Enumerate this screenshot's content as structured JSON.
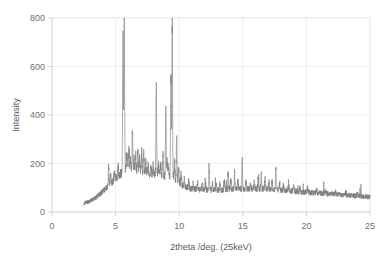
{
  "chart_data": {
    "type": "line",
    "title": "",
    "subtitle": "",
    "xlabel": "2theta /deg. (25keV)",
    "ylabel": "Intensity",
    "xlim": [
      0,
      25
    ],
    "ylim": [
      0,
      800
    ],
    "xticks": [
      0,
      5,
      10,
      15,
      20,
      25
    ],
    "yticks": [
      0,
      200,
      400,
      600,
      800
    ],
    "xtick_labels": [
      "0",
      "5",
      "10",
      "15",
      "20",
      "25"
    ],
    "ytick_labels": [
      "0",
      "200",
      "400",
      "600",
      "800"
    ],
    "grid": "both",
    "legend": "none",
    "series_name": "XRD pattern",
    "series_color": "#808080",
    "grid_color": "#e6e6e6",
    "axis_color": "#c9c9c9",
    "text_color": "#6f6f6f",
    "data_x_start": 2.5,
    "data_x_end": 25.0,
    "annotations": [],
    "notable_peaks": [
      {
        "x": 4.45,
        "y": 195
      },
      {
        "x": 5.58,
        "y": 745
      },
      {
        "x": 5.68,
        "y": 790
      },
      {
        "x": 6.05,
        "y": 250
      },
      {
        "x": 6.32,
        "y": 330
      },
      {
        "x": 6.75,
        "y": 245
      },
      {
        "x": 7.05,
        "y": 250
      },
      {
        "x": 7.22,
        "y": 240
      },
      {
        "x": 8.2,
        "y": 520
      },
      {
        "x": 8.72,
        "y": 250
      },
      {
        "x": 8.95,
        "y": 400
      },
      {
        "x": 9.35,
        "y": 560
      },
      {
        "x": 9.45,
        "y": 770
      },
      {
        "x": 9.8,
        "y": 305
      },
      {
        "x": 12.35,
        "y": 190
      },
      {
        "x": 13.85,
        "y": 165
      },
      {
        "x": 14.35,
        "y": 160
      },
      {
        "x": 14.95,
        "y": 220
      },
      {
        "x": 16.45,
        "y": 150
      },
      {
        "x": 17.6,
        "y": 185
      }
    ],
    "baseline_profile": [
      {
        "x": 2.5,
        "y": 35
      },
      {
        "x": 3.0,
        "y": 45
      },
      {
        "x": 3.5,
        "y": 62
      },
      {
        "x": 4.0,
        "y": 85
      },
      {
        "x": 4.5,
        "y": 110
      },
      {
        "x": 5.0,
        "y": 140
      },
      {
        "x": 5.5,
        "y": 160
      },
      {
        "x": 6.0,
        "y": 172
      },
      {
        "x": 6.5,
        "y": 175
      },
      {
        "x": 7.0,
        "y": 168
      },
      {
        "x": 7.5,
        "y": 160
      },
      {
        "x": 8.0,
        "y": 155
      },
      {
        "x": 8.5,
        "y": 150
      },
      {
        "x": 9.0,
        "y": 145
      },
      {
        "x": 9.5,
        "y": 140
      },
      {
        "x": 10.0,
        "y": 120
      },
      {
        "x": 10.5,
        "y": 102
      },
      {
        "x": 11.0,
        "y": 95
      },
      {
        "x": 12.0,
        "y": 92
      },
      {
        "x": 13.0,
        "y": 90
      },
      {
        "x": 14.0,
        "y": 92
      },
      {
        "x": 15.0,
        "y": 95
      },
      {
        "x": 16.0,
        "y": 95
      },
      {
        "x": 17.0,
        "y": 95
      },
      {
        "x": 18.0,
        "y": 90
      },
      {
        "x": 19.0,
        "y": 86
      },
      {
        "x": 20.0,
        "y": 82
      },
      {
        "x": 21.0,
        "y": 78
      },
      {
        "x": 22.0,
        "y": 74
      },
      {
        "x": 23.0,
        "y": 70
      },
      {
        "x": 24.0,
        "y": 66
      },
      {
        "x": 25.0,
        "y": 62
      }
    ]
  }
}
